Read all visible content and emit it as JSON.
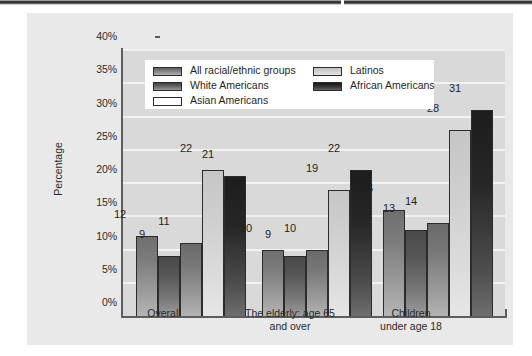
{
  "chart_data": {
    "type": "bar",
    "title": "",
    "xlabel": "",
    "ylabel": "Percentage",
    "ylim": [
      0,
      40
    ],
    "ytick_labels": [
      "0%",
      "5%",
      "10%",
      "15%",
      "20%",
      "25%",
      "30%",
      "35%",
      "40%"
    ],
    "ytick_values": [
      0,
      5,
      10,
      15,
      20,
      25,
      30,
      35,
      40
    ],
    "grid": true,
    "legend_position": "upper-left-inside",
    "categories": [
      "Overall",
      "The elderly: age 65 and over",
      "Children under age 18"
    ],
    "category_lines": [
      [
        "Overall"
      ],
      [
        "The elderly: age 65",
        "and over"
      ],
      [
        "Children",
        "under age 18"
      ]
    ],
    "series": [
      {
        "name": "All racial/ethnic groups",
        "color": "#8a8a8a",
        "values": [
          12,
          10,
          16
        ]
      },
      {
        "name": "White Americans",
        "color": "#5a5a5a",
        "values": [
          9,
          9,
          13
        ]
      },
      {
        "name": "Asian Americans",
        "color": "#868686",
        "values": [
          11,
          10,
          14
        ]
      },
      {
        "name": "Latinos",
        "color": "#d4d4d4",
        "values": [
          22,
          19,
          28
        ]
      },
      {
        "name": "African Americans",
        "color": "#262626",
        "values": [
          21,
          22,
          31
        ]
      }
    ]
  },
  "figure": {
    "panel_background": "#e9e9e9",
    "plot_background": "#d9d9d9",
    "gridline_color": "#f2f2f2",
    "axis_color": "#5d5d5d",
    "legend_background": "#ffffff"
  }
}
